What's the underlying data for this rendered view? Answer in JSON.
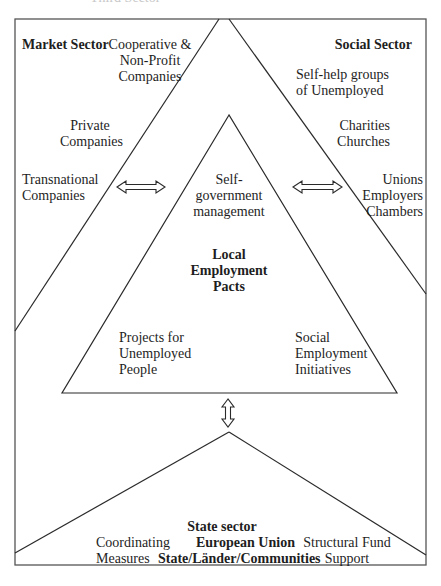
{
  "diagram": {
    "cropped_top_text": "Third Sector",
    "market_sector": {
      "title": "Market Sector",
      "items": [
        "Cooperative &\nNon-Profit\nCompanies",
        "Private\nCompanies",
        "Transnational\nCompanies"
      ]
    },
    "social_sector": {
      "title": "Social Sector",
      "items": [
        "Self-help groups\nof Unemployed",
        "Charities\nChurches",
        "Unions\nEmployers\nChambers"
      ]
    },
    "center": {
      "top": "Self-\ngovernment\nmanagement",
      "title": "Local\nEmployment\nPacts",
      "bottom_left": "Projects for\nUnemployed\nPeople",
      "bottom_right": "Social\nEmployment\nInitiatives"
    },
    "state_sector": {
      "title": "State sector",
      "left": "Coordinating\nMeasures",
      "center_line1": "European Union",
      "center_line2": "State/Länder/Communities",
      "right": "Structural Fund\nSupport"
    },
    "connectors": [
      {
        "id": "market-to-center",
        "type": "double-arrow-horizontal"
      },
      {
        "id": "center-to-social",
        "type": "double-arrow-horizontal"
      },
      {
        "id": "center-to-state",
        "type": "double-arrow-vertical"
      }
    ],
    "colors": {
      "stroke": "#2a2a2a",
      "border": "#555555",
      "text": "#1e1e1e",
      "background": "#ffffff"
    }
  }
}
